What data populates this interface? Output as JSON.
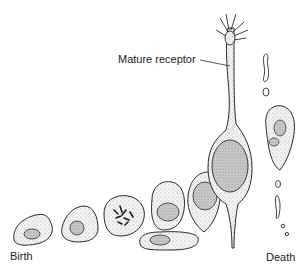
{
  "figure": {
    "type": "biological-illustration"
  },
  "labels": {
    "mature_receptor": "Mature receptor",
    "birth": "Birth",
    "death": "Death"
  },
  "colors": {
    "stroke": "#2a2a2a",
    "stipple": "#b8b8b8",
    "nucleus": "#8a8a8a",
    "background": "#ffffff"
  }
}
